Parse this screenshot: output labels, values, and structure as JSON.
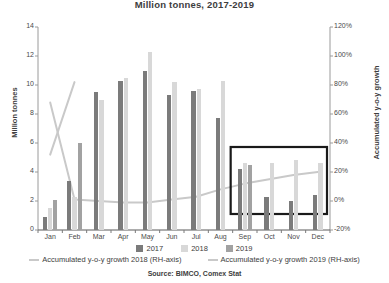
{
  "title": "Million tonnes, 2017-2019",
  "source": "Source: BIMCO, Comex Stat",
  "axis": {
    "left_title": "Million tonnes",
    "right_title": "Accumulated y-o-y growth",
    "left_ticks": [
      "14",
      "12",
      "10",
      "8",
      "6",
      "4",
      "2",
      "0"
    ],
    "right_ticks": [
      "120%",
      "100%",
      "80%",
      "60%",
      "40%",
      "20%",
      "0%",
      "-20%"
    ]
  },
  "legend": {
    "bars": [
      {
        "label": "2017",
        "color": "#7b7b7b"
      },
      {
        "label": "2018",
        "color": "#d8d8d8"
      },
      {
        "label": "2019",
        "color": "#a2a2a2"
      }
    ],
    "lines": [
      {
        "label": "Accumulated y-o-y growth 2018 (RH-axis)",
        "color": "#c9c9c9"
      },
      {
        "label": "Accumulated y-o-y growth 2019 (RH-axis)",
        "color": "#c9c9c9"
      }
    ]
  },
  "highlight_box": {
    "label": "sep-dec-highlight",
    "color": "#1a1a1a"
  },
  "chart_data": {
    "type": "bar",
    "title": "Million tonnes, 2017-2019",
    "subtitle": "",
    "xlabel": "",
    "ylabel": "Million tonnes",
    "y2label": "Accumulated y-o-y growth",
    "ylim": [
      0,
      14
    ],
    "y2lim": [
      -20,
      120
    ],
    "grid": false,
    "legend_position": "bottom",
    "categories": [
      "Jan",
      "Feb",
      "Mar",
      "Apr",
      "May",
      "Jun",
      "Jul",
      "Aug",
      "Sep",
      "Oct",
      "Nov",
      "Dec"
    ],
    "series": [
      {
        "name": "2017",
        "type": "bar",
        "color": "#7b7b7b",
        "axis": "left",
        "values": [
          0.9,
          3.4,
          9.5,
          10.3,
          11.0,
          9.3,
          9.6,
          7.7,
          4.2,
          2.3,
          2.0,
          2.4
        ]
      },
      {
        "name": "2018",
        "type": "bar",
        "color": "#d8d8d8",
        "axis": "left",
        "values": [
          1.5,
          2.3,
          9.0,
          10.5,
          12.3,
          10.2,
          9.7,
          10.3,
          4.6,
          4.6,
          4.8,
          4.6
        ]
      },
      {
        "name": "2019",
        "type": "bar",
        "color": "#a2a2a2",
        "axis": "left",
        "values": [
          2.1,
          6.0,
          null,
          null,
          null,
          null,
          null,
          null,
          4.5,
          null,
          null,
          null
        ]
      },
      {
        "name": "Accumulated y-o-y growth 2018 (RH-axis)",
        "type": "line",
        "color": "#c9c9c9",
        "axis": "right",
        "values": [
          68,
          1,
          0,
          -1,
          -1,
          1,
          3,
          8,
          12,
          15,
          18,
          20
        ]
      },
      {
        "name": "Accumulated y-o-y growth 2019 (RH-axis)",
        "type": "line",
        "color": "#c9c9c9",
        "axis": "right",
        "values": [
          32,
          82,
          null,
          null,
          null,
          null,
          null,
          null,
          null,
          null,
          null,
          null
        ]
      }
    ]
  }
}
